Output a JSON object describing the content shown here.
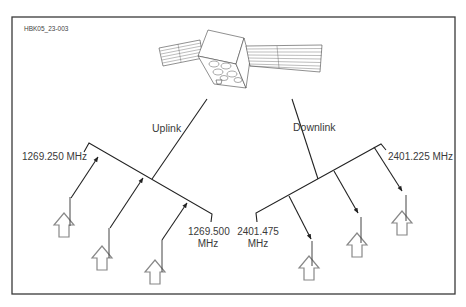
{
  "figure": {
    "id_label": "HBK05_23-003",
    "frame_color": "#3a3a3a",
    "line_color": "#222222",
    "station_color": "#777777"
  },
  "satellite": {
    "name": "satellite"
  },
  "uplink": {
    "label": "Uplink",
    "freq_low": "1269.250 MHz",
    "freq_high_line1": "1269.500",
    "freq_high_line2": "MHz",
    "station_count": 3
  },
  "downlink": {
    "label": "Downlink",
    "freq_high": "2401.225 MHz",
    "freq_low_line1": "2401.475",
    "freq_low_line2": "MHz",
    "station_count": 3
  }
}
